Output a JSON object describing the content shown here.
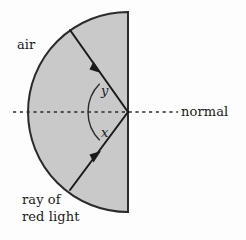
{
  "figure": {
    "type": "optics-refraction-diagram",
    "title": "",
    "background_color": "#fdfdfd",
    "medium": {
      "shape": "semicircle",
      "fill_color": "#c9c9c9",
      "stroke_color": "#2b2b2b",
      "flat_edge": "vertical-right",
      "center": {
        "x": 128,
        "y": 112
      },
      "radius": 100
    },
    "normal_line": {
      "style": "dashed",
      "color": "#2b2b2b",
      "from_x": 13,
      "to_x": 178,
      "y": 112
    },
    "rays": [
      {
        "name": "incident-ray",
        "from": {
          "x": 70,
          "y": 30
        },
        "to": {
          "x": 128,
          "y": 112
        },
        "arrow_direction": "toward-center",
        "color": "#1a1a1a"
      },
      {
        "name": "emergent-ray",
        "from": {
          "x": 70,
          "y": 190
        },
        "to": {
          "x": 128,
          "y": 112
        },
        "arrow_direction": "toward-center",
        "color": "#1a1a1a"
      }
    ],
    "angles": [
      {
        "name": "angle-y",
        "label": "y",
        "position": "above-normal"
      },
      {
        "name": "angle-x",
        "label": "x",
        "position": "below-normal"
      }
    ]
  },
  "labels": {
    "air": "air",
    "normal": "normal",
    "ray_line1": "ray of",
    "ray_line2": "red light",
    "angle_y": "y",
    "angle_x": "x"
  }
}
